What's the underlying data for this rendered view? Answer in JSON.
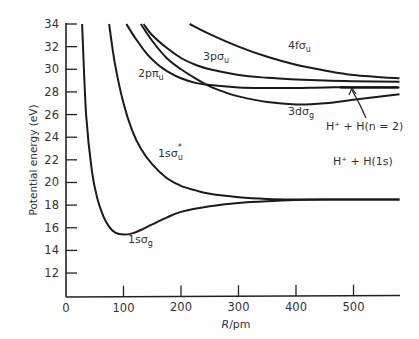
{
  "chart_data": {
    "type": "line",
    "title": "",
    "xlabel": "R/pm",
    "ylabel": "Potential energy (eV)",
    "xlim": [
      0,
      580
    ],
    "ylim": [
      10,
      34
    ],
    "grid": false,
    "x_ticks": [
      0,
      100,
      200,
      300,
      400,
      500
    ],
    "y_ticks": [
      12,
      14,
      16,
      18,
      20,
      22,
      24,
      26,
      28,
      30,
      32,
      34
    ],
    "series": [
      {
        "name": "1sσg",
        "label": "1sσ",
        "sub": "g",
        "sup": "",
        "x": [
          28,
          35,
          45,
          55,
          65,
          75,
          85,
          100,
          115,
          130,
          150,
          175,
          200,
          250,
          300,
          350,
          400,
          450,
          500,
          580
        ],
        "y": [
          34,
          26,
          21,
          18.5,
          17,
          16.1,
          15.6,
          15.4,
          15.5,
          15.8,
          16.3,
          16.9,
          17.4,
          17.9,
          18.2,
          18.35,
          18.45,
          18.5,
          18.5,
          18.5
        ]
      },
      {
        "name": "1sσu*",
        "label": "1sσ",
        "sub": "u",
        "sup": "*",
        "x": [
          75,
          85,
          100,
          115,
          130,
          150,
          175,
          200,
          225,
          250,
          300,
          350,
          400,
          450,
          500,
          580
        ],
        "y": [
          34,
          30.5,
          27,
          24.6,
          23.0,
          21.6,
          20.4,
          19.7,
          19.3,
          19.0,
          18.7,
          18.55,
          18.5,
          18.5,
          18.5,
          18.5
        ]
      },
      {
        "name": "2pπu",
        "label": "2pπ",
        "sub": "u",
        "sup": "",
        "x": [
          105,
          120,
          140,
          160,
          180,
          200,
          225,
          250,
          300,
          350,
          400,
          450,
          500,
          580
        ],
        "y": [
          34,
          32.8,
          31.4,
          30.4,
          29.7,
          29.2,
          28.8,
          28.6,
          28.4,
          28.35,
          28.35,
          28.4,
          28.4,
          28.4
        ]
      },
      {
        "name": "3dσg",
        "label": "3dσ",
        "sub": "g",
        "sup": "",
        "x": [
          130,
          150,
          175,
          200,
          225,
          250,
          275,
          300,
          350,
          400,
          450,
          500,
          580
        ],
        "y": [
          34,
          32.5,
          31.0,
          30.0,
          29.2,
          28.5,
          28.0,
          27.6,
          27.1,
          26.9,
          27.0,
          27.3,
          27.8
        ]
      },
      {
        "name": "3pσu",
        "label": "3pσ",
        "sub": "u",
        "sup": "",
        "x": [
          135,
          150,
          175,
          200,
          225,
          250,
          300,
          350,
          400,
          450,
          500,
          580
        ],
        "y": [
          34,
          33.0,
          31.9,
          31.0,
          30.4,
          30.0,
          29.5,
          29.25,
          29.1,
          29.0,
          28.95,
          28.9
        ]
      },
      {
        "name": "4fσu",
        "label": "4fσ",
        "sub": "u",
        "sup": "",
        "x": [
          215,
          250,
          300,
          350,
          400,
          450,
          500,
          580
        ],
        "y": [
          34,
          33.1,
          32.0,
          31.1,
          30.4,
          29.9,
          29.5,
          29.2
        ]
      }
    ],
    "annotations": [
      {
        "text": "H⁺ + H(1s)",
        "x": 470,
        "y": 19.3
      },
      {
        "text": "H⁺ + H(n = 2)",
        "x": 470,
        "y": 24.7,
        "arrow_to": [
          470,
          28.4
        ]
      }
    ]
  }
}
